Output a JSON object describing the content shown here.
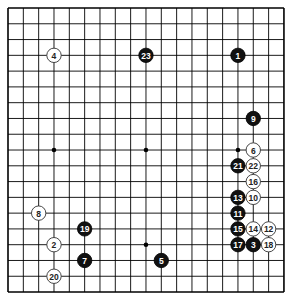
{
  "board": {
    "size": 19,
    "origin_x": 8,
    "origin_y": 8,
    "spacing_x": 15.33,
    "spacing_y": 15.78,
    "line_color": "#000000",
    "background": "#ffffff",
    "star_points": [
      [
        3,
        3
      ],
      [
        9,
        3
      ],
      [
        15,
        3
      ],
      [
        3,
        9
      ],
      [
        9,
        9
      ],
      [
        15,
        9
      ],
      [
        3,
        15
      ],
      [
        9,
        15
      ],
      [
        15,
        15
      ]
    ]
  },
  "stones": [
    {
      "n": "1",
      "color": "black",
      "col": 15,
      "row": 3
    },
    {
      "n": "2",
      "color": "white",
      "col": 3,
      "row": 15
    },
    {
      "n": "3",
      "color": "black",
      "col": 16,
      "row": 15
    },
    {
      "n": "4",
      "color": "white",
      "col": 3,
      "row": 3
    },
    {
      "n": "5",
      "color": "black",
      "col": 10,
      "row": 16
    },
    {
      "n": "6",
      "color": "white",
      "col": 16,
      "row": 9
    },
    {
      "n": "7",
      "color": "black",
      "col": 5,
      "row": 16
    },
    {
      "n": "8",
      "color": "white",
      "col": 2,
      "row": 13
    },
    {
      "n": "9",
      "color": "black",
      "col": 16,
      "row": 7
    },
    {
      "n": "10",
      "color": "white",
      "col": 16,
      "row": 12
    },
    {
      "n": "11",
      "color": "black",
      "col": 15,
      "row": 13
    },
    {
      "n": "12",
      "color": "white",
      "col": 17,
      "row": 14
    },
    {
      "n": "13",
      "color": "black",
      "col": 15,
      "row": 12
    },
    {
      "n": "14",
      "color": "white",
      "col": 16,
      "row": 14
    },
    {
      "n": "15",
      "color": "black",
      "col": 15,
      "row": 14
    },
    {
      "n": "16",
      "color": "white",
      "col": 16,
      "row": 11
    },
    {
      "n": "17",
      "color": "black",
      "col": 15,
      "row": 15
    },
    {
      "n": "18",
      "color": "white",
      "col": 17,
      "row": 15
    },
    {
      "n": "19",
      "color": "black",
      "col": 5,
      "row": 14
    },
    {
      "n": "20",
      "color": "white",
      "col": 3,
      "row": 17
    },
    {
      "n": "21",
      "color": "black",
      "col": 15,
      "row": 10
    },
    {
      "n": "22",
      "color": "white",
      "col": 16,
      "row": 10
    },
    {
      "n": "23",
      "color": "black",
      "col": 9,
      "row": 3
    }
  ]
}
